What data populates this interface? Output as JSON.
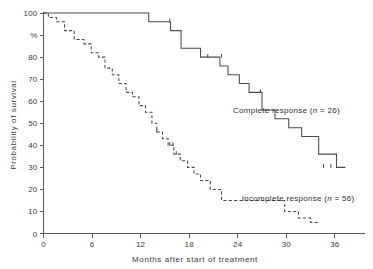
{
  "chart_data": {
    "type": "line",
    "subtype": "kaplan-meier-step",
    "title": "",
    "xlabel": "Months after start of treatment",
    "ylabel": "Probability of survival",
    "yunit": "%",
    "xlim": [
      0,
      37.5
    ],
    "ylim": [
      0,
      100
    ],
    "xticks": [
      0,
      6,
      12,
      18,
      24,
      30,
      36
    ],
    "xtick_labels": [
      "0",
      "6",
      "12",
      "18",
      "24",
      "30",
      "36"
    ],
    "yticks": [
      0,
      10,
      20,
      30,
      40,
      50,
      60,
      70,
      80,
      90,
      100
    ],
    "ytick_labels": [
      "0",
      "10",
      "20",
      "30",
      "40",
      "50",
      "60",
      "70",
      "80",
      "%",
      "100"
    ],
    "grid": false,
    "legend_position": "inline-annotation",
    "series": [
      {
        "name": "Complete response",
        "n": 26,
        "label": "Complete response (n = 26)",
        "label_prefix": "Complete response (",
        "label_italic": "n",
        "label_suffix": " = 26)",
        "style": "solid",
        "color": "#4a4a4a",
        "label_x": 23.4,
        "label_y": 56,
        "x": [
          0,
          11.8,
          13.0,
          14.6,
          15.7,
          17.0,
          19.4,
          20.6,
          21.8,
          22.8,
          24.2,
          25.4,
          27.0,
          28.6,
          30.3,
          31.9,
          34.0,
          36.2
        ],
        "y": [
          100,
          100,
          96,
          96,
          92,
          84,
          80,
          80,
          76,
          72,
          68,
          64,
          56,
          52,
          48,
          44,
          36,
          30
        ],
        "censor_x": [
          15.6,
          20.3,
          22.0,
          26.8,
          34.6,
          35.5
        ],
        "censor_y": [
          96,
          80,
          80,
          64,
          30,
          30
        ]
      },
      {
        "name": "Incomplete response",
        "n": 56,
        "label": "Incomplete response (n = 56)",
        "label_prefix": "Incomplete response (",
        "label_italic": "n",
        "label_suffix": " = 56)",
        "style": "dashed",
        "color": "#4a4a4a",
        "label_x": 24.5,
        "label_y": 16,
        "x": [
          0,
          0.6,
          1.6,
          2.6,
          3.8,
          5.0,
          5.9,
          6.8,
          7.6,
          8.5,
          9.3,
          10.2,
          11.0,
          11.8,
          12.6,
          13.4,
          14.0,
          14.7,
          15.4,
          16.1,
          16.9,
          17.8,
          18.6,
          19.4,
          20.6,
          22.0,
          26.6,
          29.8,
          31.5,
          33.0
        ],
        "y": [
          100,
          98,
          96,
          92,
          88,
          86,
          82,
          80,
          75,
          72,
          68,
          64,
          62,
          58,
          55,
          50,
          46,
          43,
          40,
          36,
          33,
          30,
          27,
          24,
          20,
          15,
          15,
          10,
          7,
          5
        ],
        "censor_x": [
          14.0,
          15.6,
          16.0,
          16.4
        ],
        "censor_y": [
          46,
          40,
          40,
          36
        ]
      }
    ]
  }
}
